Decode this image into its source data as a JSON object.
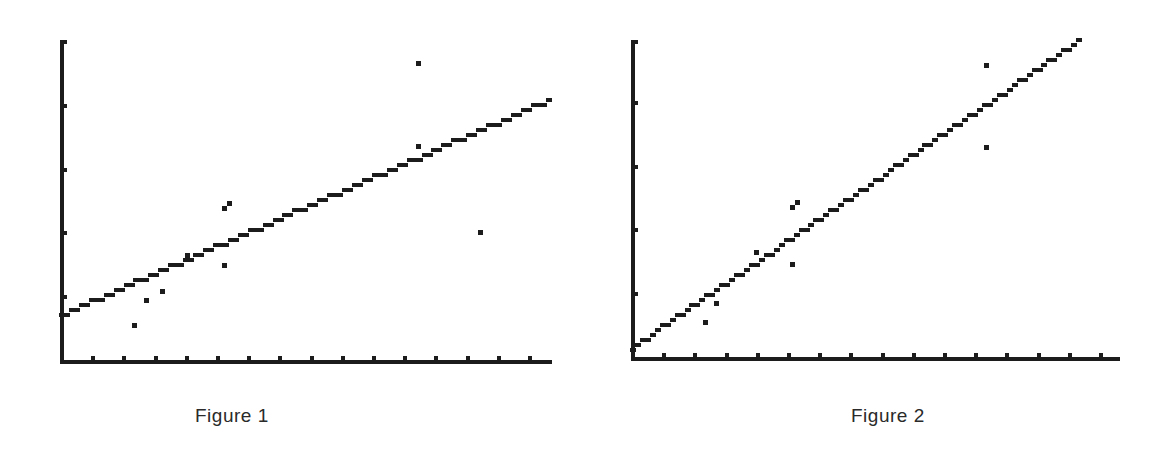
{
  "chart_data": [
    {
      "type": "scatter",
      "title": "",
      "caption": "Figure 1",
      "xlabel": "",
      "ylabel": "",
      "xlim": [
        0,
        15.6
      ],
      "ylim": [
        0,
        5
      ],
      "x_ticks": [
        1,
        2,
        3,
        4,
        5,
        6,
        7,
        8,
        9,
        10,
        11,
        12,
        13,
        14,
        15
      ],
      "y_ticks": [
        1,
        2,
        3,
        4,
        5
      ],
      "tick_labels": false,
      "grid": false,
      "legend": "none",
      "series": [
        {
          "name": "observations",
          "kind": "points",
          "points": [
            [
              2.3,
              0.56
            ],
            [
              2.7,
              0.96
            ],
            [
              3.2,
              1.1
            ],
            [
              4.0,
              1.66
            ],
            [
              5.2,
              1.5
            ],
            [
              5.2,
              2.4
            ],
            [
              5.35,
              2.48
            ],
            [
              11.4,
              3.37
            ],
            [
              11.4,
              4.67
            ],
            [
              13.4,
              2.02
            ]
          ]
        },
        {
          "name": "fitted line",
          "kind": "line",
          "points": [
            [
              0,
              0.72
            ],
            [
              15.6,
              4.08
            ]
          ]
        }
      ]
    },
    {
      "type": "scatter",
      "title": "",
      "caption": "Figure 2",
      "xlabel": "",
      "ylabel": "",
      "xlim": [
        0,
        15.6
      ],
      "ylim": [
        0,
        5
      ],
      "x_ticks": [
        1,
        2,
        3,
        4,
        5,
        6,
        7,
        8,
        9,
        10,
        11,
        12,
        13,
        14,
        15
      ],
      "y_ticks": [
        1,
        2,
        3,
        4,
        5
      ],
      "tick_labels": false,
      "grid": false,
      "legend": "none",
      "series": [
        {
          "name": "observations",
          "kind": "points",
          "points": [
            [
              2.3,
              0.56
            ],
            [
              2.65,
              0.86
            ],
            [
              3.95,
              1.66
            ],
            [
              5.1,
              1.48
            ],
            [
              5.1,
              2.36
            ],
            [
              5.25,
              2.44
            ],
            [
              11.3,
              3.3
            ],
            [
              11.3,
              4.6
            ]
          ]
        },
        {
          "name": "fitted line",
          "kind": "line",
          "points": [
            [
              0,
              0.16
            ],
            [
              14.3,
              4.96
            ]
          ]
        }
      ]
    }
  ],
  "layout": {
    "figures": [
      {
        "x0": 62,
        "y0": 361,
        "x_unit": 31.2,
        "y_unit": 63.8,
        "x_end": 550,
        "y_top": 40
      },
      {
        "x0": 48,
        "y0": 358,
        "x_unit": 31.2,
        "y_unit": 63.8,
        "x_end": 533,
        "y_top": 40
      }
    ],
    "ink": "#1c1c1c"
  }
}
